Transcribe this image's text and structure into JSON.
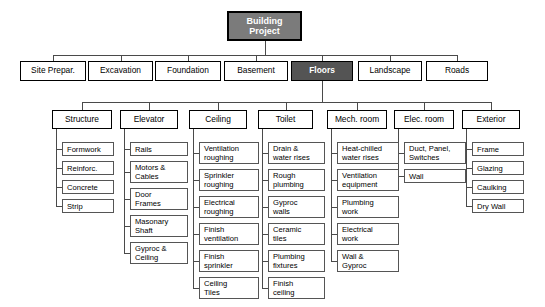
{
  "diagram": {
    "type": "work-breakdown-structure",
    "colors": {
      "root_fill": "#7b7b7b",
      "highlight_fill": "#545454",
      "node_fill": "#ffffff",
      "border": "#000000",
      "line": "#4a4a4a",
      "background": "#ffffff"
    },
    "root": {
      "label": "Building Project"
    },
    "level2": [
      {
        "label": "Site Prepar.",
        "highlighted": false
      },
      {
        "label": "Excavation",
        "highlighted": false
      },
      {
        "label": "Foundation",
        "highlighted": false
      },
      {
        "label": "Basement",
        "highlighted": false
      },
      {
        "label": "Floors",
        "highlighted": true
      },
      {
        "label": "Landscape",
        "highlighted": false
      },
      {
        "label": "Roads",
        "highlighted": false
      }
    ],
    "level3": [
      {
        "label": "Structure"
      },
      {
        "label": "Elevator"
      },
      {
        "label": "Ceiling"
      },
      {
        "label": "Toilet"
      },
      {
        "label": "Mech. room"
      },
      {
        "label": "Elec. room"
      },
      {
        "label": "Exterior"
      }
    ],
    "leaves": {
      "structure": [
        "Formwork",
        "Reinforc.",
        "Concrete",
        "Strip"
      ],
      "elevator": [
        "Rails",
        "Motors & Cables",
        "Door Frames",
        "Masonary Shaft",
        "Gyproc & Ceiling"
      ],
      "ceiling": [
        "Ventilation roughing",
        "Sprinkler roughing",
        "Electrical roughing",
        "Finish ventilation",
        "Finish sprinkler",
        "Ceiling Tiles"
      ],
      "toilet": [
        "Drain & water rises",
        "Rough plumbing",
        "Gyproc walls",
        "Ceramic tiles",
        "Plumbing fixtures",
        "Finish ceiling"
      ],
      "mech_room": [
        "Heat-chilled water rises",
        "Ventilation equipment",
        "Plumbing work",
        "Electrical work",
        "Wall & Gyproc"
      ],
      "elec_room": [
        "Duct, Panel, Switches",
        "Wall"
      ],
      "exterior": [
        "Frame",
        "Glazing",
        "Caulking",
        "Dry Wall"
      ]
    }
  }
}
